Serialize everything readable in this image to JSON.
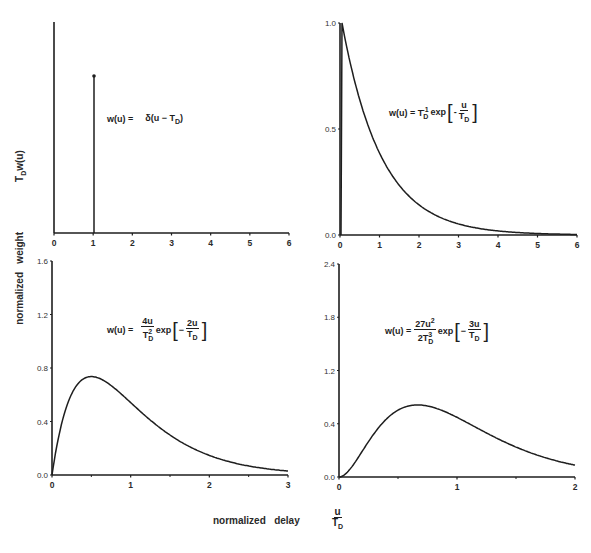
{
  "figure": {
    "ylabel_words": [
      "normalized",
      "weight"
    ],
    "ylabel_symbol": "T",
    "ylabel_symbol_sub": "D",
    "ylabel_symbol_tail": "w(u)",
    "xlabel_words": [
      "normalized",
      "delay"
    ],
    "xlabel_frac_num": "u",
    "xlabel_frac_den": "T",
    "xlabel_frac_den_sub": "D"
  },
  "panels": [
    {
      "id": "top-left",
      "formula": {
        "lhs": "w(u) =",
        "rhs": "δ(u − T",
        "rhs_sub": "D",
        "rhs_tail": ")"
      },
      "xticks": [
        "0",
        "1",
        "2",
        "3",
        "4",
        "5",
        "6"
      ],
      "yticks": []
    },
    {
      "id": "top-right",
      "formula": {
        "lhs": "w(u) = T",
        "lhs_sub": "D",
        "lhs_sup": "-1",
        "exp": "exp",
        "minus": "-",
        "num": "u",
        "den": "T",
        "den_sub": "D"
      },
      "xticks": [
        "0",
        "1",
        "2",
        "3",
        "4",
        "5",
        "6"
      ],
      "yticks": [
        "0.0",
        "0.5",
        "1.0"
      ]
    },
    {
      "id": "bottom-left",
      "formula": {
        "lhs": "w(u) =",
        "c_num": "4u",
        "c_den": "T",
        "c_den_sub": "D",
        "c_den_sup": "2",
        "exp": "exp",
        "minus": "−",
        "num": "2u",
        "den": "T",
        "den_sub": "D"
      },
      "xticks": [
        "0",
        "1",
        "2",
        "3"
      ],
      "yticks": [
        "0.0",
        "0.4",
        "0.8",
        "1.2",
        "1.6"
      ]
    },
    {
      "id": "bottom-right",
      "formula": {
        "lhs": "w(u) =",
        "c_num": "27u",
        "c_num_sup": "2",
        "c_den": "2T",
        "c_den_sub": "D",
        "c_den_sup": "3",
        "exp": "exp",
        "minus": "−",
        "num": "3u",
        "den": "T",
        "den_sub": "D"
      },
      "xticks": [
        "0",
        "1",
        "2"
      ],
      "yticks": [
        "0.0",
        "0.4",
        "1.2",
        "1.8",
        "2.4"
      ]
    }
  ],
  "chart_data": [
    {
      "type": "line",
      "title": "w(u) = δ(u − T_D)",
      "xlabel": "normalized delay u/T_D",
      "ylabel": "normalized weight T_D w(u)",
      "xlim": [
        0,
        6
      ],
      "x": [
        1,
        1
      ],
      "series": [
        {
          "name": "delta impulse at u/T_D = 1",
          "values": [
            0,
            "impulse"
          ]
        }
      ],
      "grid": false
    },
    {
      "type": "line",
      "title": "w(u) = T_D^-1 exp[-u/T_D]",
      "xlabel": "normalized delay u/T_D",
      "ylabel": "normalized weight T_D w(u)",
      "xlim": [
        0,
        6
      ],
      "ylim": [
        0,
        1.0
      ],
      "x": [
        0,
        0.5,
        1,
        1.5,
        2,
        2.5,
        3,
        4,
        5,
        6
      ],
      "series": [
        {
          "name": "exponential",
          "values": [
            1.0,
            0.61,
            0.37,
            0.22,
            0.14,
            0.08,
            0.05,
            0.02,
            0.01,
            0.0
          ]
        }
      ],
      "grid": false
    },
    {
      "type": "line",
      "title": "w(u) = (4u/T_D^2) exp[-2u/T_D]",
      "xlabel": "normalized delay u/T_D",
      "ylabel": "normalized weight T_D w(u)",
      "xlim": [
        0,
        3
      ],
      "ylim": [
        0,
        1.6
      ],
      "x": [
        0,
        0.25,
        0.5,
        0.75,
        1,
        1.5,
        2,
        2.5,
        3
      ],
      "series": [
        {
          "name": "gamma order 2",
          "values": [
            0.0,
            0.61,
            0.74,
            0.67,
            0.54,
            0.3,
            0.15,
            0.07,
            0.03
          ]
        }
      ],
      "grid": false
    },
    {
      "type": "line",
      "title": "w(u) = (27u^2/2T_D^3) exp[-3u/T_D]",
      "xlabel": "normalized delay u/T_D",
      "ylabel": "normalized weight T_D w(u)",
      "xlim": [
        0,
        2
      ],
      "ylim": [
        0,
        2.4
      ],
      "x": [
        0,
        0.25,
        0.5,
        0.667,
        0.75,
        1,
        1.25,
        1.5,
        1.75,
        2
      ],
      "series": [
        {
          "name": "gamma order 3",
          "values": [
            0.0,
            0.4,
            0.75,
            0.81,
            0.8,
            0.67,
            0.5,
            0.34,
            0.22,
            0.13
          ]
        }
      ],
      "grid": false
    }
  ]
}
